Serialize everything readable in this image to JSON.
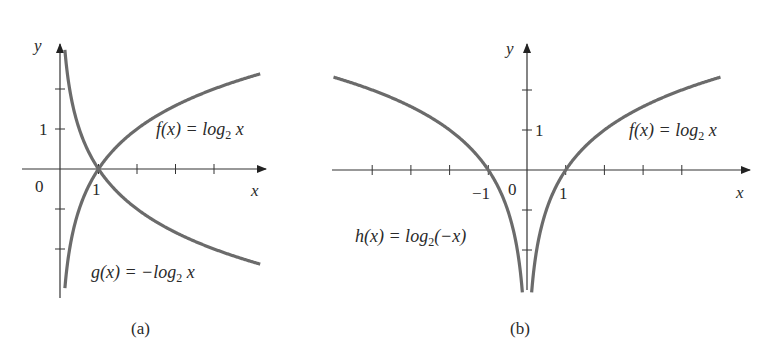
{
  "chart_data": [
    {
      "type": "line",
      "panel": "(a)",
      "caption": "(a)",
      "xlabel": "x",
      "ylabel": "y",
      "origin_label": "0",
      "x_tick_labels": [
        "1"
      ],
      "y_tick_labels": [
        "1"
      ],
      "xlim": [
        -1,
        5.1
      ],
      "ylim": [
        -3.1,
        4.2
      ],
      "grid": false,
      "series": [
        {
          "name": "f(x) = log₂ x",
          "label": "f(x) = log2 x",
          "function": "log2(x)",
          "x": [
            0.125,
            0.25,
            0.5,
            1,
            2,
            3,
            4,
            5
          ],
          "values": [
            -3,
            -2,
            -1,
            0,
            1,
            1.585,
            2,
            2.32
          ]
        },
        {
          "name": "g(x) = −log₂ x",
          "label": "g(x) = -log2 x",
          "function": "-log2(x)",
          "x": [
            0.125,
            0.25,
            0.5,
            1,
            2,
            3,
            4,
            5
          ],
          "values": [
            3,
            2,
            1,
            0,
            -1,
            -1.585,
            -2,
            -2.32
          ]
        }
      ]
    },
    {
      "type": "line",
      "panel": "(b)",
      "caption": "(b)",
      "xlabel": "x",
      "ylabel": "y",
      "origin_label": "0",
      "x_tick_labels": [
        "−1",
        "1"
      ],
      "y_tick_labels": [
        "1"
      ],
      "xlim": [
        -5.2,
        5.8
      ],
      "ylim": [
        -3.1,
        4.2
      ],
      "grid": false,
      "series": [
        {
          "name": "f(x) = log₂ x",
          "label": "f(x) = log2 x",
          "function": "log2(x)",
          "x": [
            0.125,
            0.25,
            0.5,
            1,
            2,
            3,
            4,
            5
          ],
          "values": [
            -3,
            -2,
            -1,
            0,
            1,
            1.585,
            2,
            2.32
          ]
        },
        {
          "name": "h(x) = log₂(−x)",
          "label": "h(x) = log2(-x)",
          "function": "log2(-x)",
          "x": [
            -5,
            -4,
            -3,
            -2,
            -1,
            -0.5,
            -0.25,
            -0.125
          ],
          "values": [
            2.32,
            2,
            1.585,
            1,
            0,
            -1,
            -2,
            -3
          ]
        }
      ]
    }
  ],
  "labels": {
    "a": {
      "y": "y",
      "x": "x",
      "zero": "0",
      "one_x": "1",
      "one_y": "1",
      "f_pre": "f(x) = log",
      "f_sub": "2",
      "f_post": " x",
      "g_pre": "g(x) = −log",
      "g_sub": "2",
      "g_post": " x",
      "caption": "(a)"
    },
    "b": {
      "y": "y",
      "x": "x",
      "zero": "0",
      "neg_one": "−1",
      "one_x": "1",
      "one_y": "1",
      "f_pre": "f(x) = log",
      "f_sub": "2",
      "f_post": " x",
      "h_pre": "h(x) = log",
      "h_sub": "2",
      "h_post": "(−x)",
      "caption": "(b)"
    }
  },
  "colors": {
    "curve": "#6b6b6b",
    "axis": "#333333",
    "text": "#2a2a2a"
  }
}
